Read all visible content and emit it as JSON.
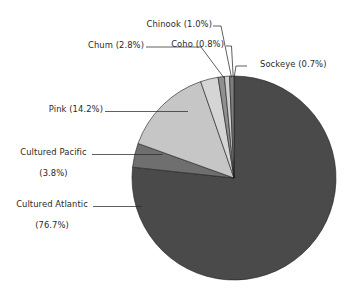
{
  "chart_data": {
    "type": "pie",
    "title": "",
    "subtitle": "",
    "xlabel": "",
    "ylabel": "",
    "legend_position": "none",
    "grid": false,
    "units": "percent",
    "start_angle_deg": 0,
    "direction": "clockwise",
    "categories": [
      "Cultured Atlantic",
      "Cultured Pacific",
      "Pink",
      "Chum",
      "Chinook",
      "Coho",
      "Sockeye"
    ],
    "values": [
      76.7,
      3.8,
      14.2,
      2.8,
      1.0,
      0.8,
      0.7
    ],
    "slices": [
      {
        "name": "Cultured Atlantic",
        "value": 76.7,
        "value_text": "(76.7%)",
        "label_line1": "Cultured Atlantic",
        "label_line2": "(76.7%)",
        "color": "#4a4a4a"
      },
      {
        "name": "Cultured Pacific",
        "value": 3.8,
        "value_text": "(3.8%)",
        "label_line1": "Cultured Pacific",
        "label_line2": "(3.8%)",
        "color": "#6f6f6f"
      },
      {
        "name": "Pink",
        "value": 14.2,
        "value_text": "(14.2%)",
        "label_line1": "Pink (14.2%)",
        "label_line2": "",
        "color": "#c6c6c6"
      },
      {
        "name": "Chum",
        "value": 2.8,
        "value_text": "(2.8%)",
        "label_line1": "Chum (2.8%)",
        "label_line2": "",
        "color": "#d5d5d5"
      },
      {
        "name": "Chinook",
        "value": 1.0,
        "value_text": "(1.0%)",
        "label_line1": "Chinook (1.0%)",
        "label_line2": "",
        "color": "#8f8f8f"
      },
      {
        "name": "Coho",
        "value": 0.8,
        "value_text": "(0.8%)",
        "label_line1": "Coho (0.8%)",
        "label_line2": "",
        "color": "#cfcfcf"
      },
      {
        "name": "Sockeye",
        "value": 0.7,
        "value_text": "(0.7%)",
        "label_line1": "Sockeye (0.7%)",
        "label_line2": "",
        "color": "#7d7d7d"
      }
    ],
    "colors": {
      "background": "#ffffff",
      "text": "#2a2a2a",
      "leader_line": "#2b2b2b",
      "slice_outline": "#1c1c1c"
    }
  },
  "labels": {
    "chinook": "Chinook (1.0%)",
    "coho": "Coho (0.8%)",
    "sockeye": "Sockeye (0.7%)",
    "chum": "Chum (2.8%)",
    "pink": "Pink (14.2%)",
    "cultured_pacific_line1": "Cultured Pacific",
    "cultured_pacific_line2": "(3.8%)",
    "cultured_atlantic_line1": "Cultured Atlantic",
    "cultured_atlantic_line2": "(76.7%)"
  }
}
